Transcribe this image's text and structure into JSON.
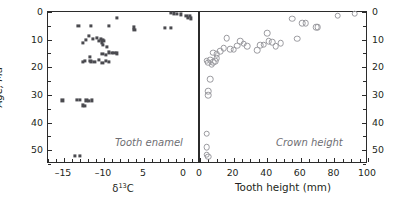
{
  "figure": {
    "shared_y_axis_title": "Age, Ma"
  },
  "panels": [
    {
      "id": "tooth-enamel",
      "caption": "Tooth enamel",
      "marker": "filled-square",
      "marker_color": "#4a4a4f",
      "x_axis": {
        "title_plain": "δ¹³C",
        "title_base": "δ",
        "title_sup": "13",
        "title_tail": "C",
        "min": -17,
        "max": 2,
        "major_ticks": [
          -15,
          -10,
          -5,
          0
        ],
        "major_tick_labels": [
          "–15",
          "–10",
          "5",
          "0"
        ],
        "minor_tick_step": 1
      },
      "y_axis": {
        "title": "Age, Ma",
        "min": 0,
        "max": 55,
        "inverted": true,
        "labels_side": "left",
        "major_ticks": [
          0,
          10,
          20,
          30,
          40,
          50
        ],
        "major_tick_labels": [
          "0",
          "10",
          "20",
          "30",
          "40",
          "50"
        ],
        "minor_tick_step": 5
      }
    },
    {
      "id": "crown-height",
      "caption": "Crown height",
      "marker": "open-circle",
      "marker_color": "#9a9a9f",
      "x_axis": {
        "title_plain": "Tooth height (mm)",
        "min": 0,
        "max": 100,
        "major_ticks": [
          0,
          20,
          40,
          60,
          80,
          100
        ],
        "major_tick_labels": [
          "0",
          "20",
          "40",
          "60",
          "80",
          "100"
        ],
        "minor_tick_step": 5
      },
      "y_axis": {
        "title": "Age, Ma",
        "min": 0,
        "max": 55,
        "inverted": true,
        "labels_side": "right",
        "major_ticks": [
          0,
          10,
          20,
          30,
          40,
          50
        ],
        "major_tick_labels": [
          "0",
          "10",
          "20",
          "30",
          "40",
          "50"
        ],
        "minor_tick_step": 5
      }
    }
  ],
  "chart_data": [
    {
      "type": "scatter",
      "title": "Tooth enamel",
      "xlabel": "δ¹³C",
      "ylabel": "Age, Ma",
      "xlim": [
        -17,
        2
      ],
      "ylim": [
        55,
        0
      ],
      "y_inverted": true,
      "grid": false,
      "legend": "none",
      "marker": "filled-square",
      "series": [
        {
          "name": "Tooth enamel δ13C",
          "points": [
            [
              -8.4,
              2.0
            ],
            [
              -1.6,
              0.4
            ],
            [
              -1.3,
              0.5
            ],
            [
              -0.9,
              0.6
            ],
            [
              -0.4,
              0.9
            ],
            [
              0.3,
              1.5
            ],
            [
              0.5,
              2.0
            ],
            [
              0.7,
              1.4
            ],
            [
              0.9,
              2.3
            ],
            [
              -13.2,
              5.0
            ],
            [
              -11.6,
              5.0
            ],
            [
              -9.4,
              5.0
            ],
            [
              -6.3,
              5.6
            ],
            [
              -6.2,
              6.4
            ],
            [
              -2.4,
              5.8
            ],
            [
              -1.6,
              5.8
            ],
            [
              -11.9,
              8.6
            ],
            [
              -11.4,
              9.8
            ],
            [
              -10.9,
              9.4
            ],
            [
              -10.6,
              10.4
            ],
            [
              -10.4,
              9.6
            ],
            [
              -10.3,
              11.0
            ],
            [
              -10.2,
              10.2
            ],
            [
              -10.1,
              11.8
            ],
            [
              -10.0,
              10.6
            ],
            [
              -12.3,
              10.1
            ],
            [
              -12.6,
              11.2
            ],
            [
              -9.6,
              12.6
            ],
            [
              -9.4,
              14.6
            ],
            [
              -9.0,
              14.8
            ],
            [
              -8.7,
              14.9
            ],
            [
              -8.4,
              15.0
            ],
            [
              -9.8,
              15.4
            ],
            [
              -10.2,
              15.2
            ],
            [
              -11.8,
              16.2
            ],
            [
              -11.7,
              17.6
            ],
            [
              -11.6,
              18.2
            ],
            [
              -11.2,
              18.0
            ],
            [
              -12.4,
              17.8
            ],
            [
              -12.6,
              18.1
            ],
            [
              -10.6,
              17.4
            ],
            [
              -10.2,
              18.4
            ],
            [
              -9.8,
              17.8
            ],
            [
              -9.4,
              18.2
            ],
            [
              -15.2,
              32.0
            ],
            [
              -13.4,
              31.8
            ],
            [
              -13.0,
              31.9
            ],
            [
              -12.2,
              32.0
            ],
            [
              -11.9,
              32.1
            ],
            [
              -11.5,
              32.0
            ],
            [
              -12.6,
              33.8
            ],
            [
              -12.4,
              34.0
            ],
            [
              -13.6,
              52.0
            ],
            [
              -13.0,
              52.0
            ]
          ]
        }
      ]
    },
    {
      "type": "scatter",
      "title": "Crown height",
      "xlabel": "Tooth height (mm)",
      "ylabel": "Age, Ma",
      "xlim": [
        0,
        100
      ],
      "ylim": [
        55,
        0
      ],
      "y_inverted": true,
      "grid": false,
      "legend": "none",
      "marker": "open-circle",
      "series": [
        {
          "name": "Crown height",
          "points": [
            [
              92,
              0.6
            ],
            [
              82,
              1.4
            ],
            [
              55,
              2.4
            ],
            [
              61,
              4.0
            ],
            [
              63,
              4.1
            ],
            [
              69,
              5.6
            ],
            [
              70,
              5.6
            ],
            [
              58,
              9.6
            ],
            [
              40,
              7.6
            ],
            [
              41,
              10.6
            ],
            [
              43,
              11.0
            ],
            [
              38,
              11.8
            ],
            [
              45,
              12.4
            ],
            [
              48,
              11.2
            ],
            [
              24,
              10.6
            ],
            [
              26,
              11.4
            ],
            [
              22,
              12.2
            ],
            [
              28,
              12.3
            ],
            [
              16,
              9.4
            ],
            [
              14,
              13.0
            ],
            [
              18,
              13.4
            ],
            [
              20,
              13.6
            ],
            [
              34,
              13.8
            ],
            [
              36,
              12.0
            ],
            [
              8,
              14.8
            ],
            [
              10,
              15.2
            ],
            [
              12,
              14.2
            ],
            [
              4,
              17.6
            ],
            [
              5,
              18.4
            ],
            [
              6,
              17.2
            ],
            [
              7,
              19.0
            ],
            [
              8,
              18.2
            ],
            [
              9,
              17.8
            ],
            [
              10,
              16.8
            ],
            [
              6,
              24.4
            ],
            [
              5,
              28.6
            ],
            [
              5,
              30.0
            ],
            [
              4,
              44.0
            ],
            [
              4,
              49.0
            ],
            [
              4,
              51.6
            ],
            [
              5,
              52.4
            ]
          ]
        }
      ]
    }
  ]
}
